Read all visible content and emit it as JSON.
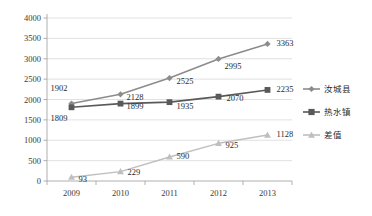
{
  "chart_data": {
    "type": "line",
    "title": "",
    "subtitle": "",
    "xlabel": "",
    "ylabel": "",
    "categories": [
      "2009",
      "2010",
      "2011",
      "2012",
      "2013"
    ],
    "ylim": [
      0,
      4000
    ],
    "ytick_values": [
      0,
      500,
      1000,
      1500,
      2000,
      2500,
      3000,
      3500,
      4000
    ],
    "ytick_labels": [
      "0",
      "500",
      "1000",
      "1500",
      "2000",
      "2500",
      "3000",
      "3500",
      "4000"
    ],
    "grid": true,
    "legend_position": "right",
    "series": [
      {
        "name": "汝城县",
        "marker": "diamond",
        "color": "#8c8c8c",
        "values": [
          1902,
          2128,
          2525,
          2995,
          3363
        ],
        "labels": [
          "1902",
          "2128",
          "2525",
          "2995",
          "3363"
        ]
      },
      {
        "name": "热水镇",
        "marker": "square",
        "color": "#595959",
        "values": [
          1809,
          1899,
          1935,
          2070,
          2235
        ],
        "labels": [
          "1809",
          "1899",
          "1935",
          "2070",
          "2235"
        ]
      },
      {
        "name": "差值",
        "marker": "triangle",
        "color": "#bfbfbf",
        "values": [
          93,
          229,
          590,
          925,
          1128
        ],
        "labels": [
          "93",
          "229",
          "590",
          "925",
          "1128"
        ]
      }
    ]
  },
  "legend": {
    "items": [
      {
        "label": "汝城县",
        "marker": "diamond",
        "color": "#8c8c8c"
      },
      {
        "label": "热水镇",
        "marker": "square",
        "color": "#595959"
      },
      {
        "label": "差值",
        "marker": "triangle",
        "color": "#bfbfbf"
      }
    ]
  },
  "colors": {
    "background": "#ffffff",
    "grid": "#d9d9d9",
    "axis": "#a6a6a6",
    "text": "#2b2b2b",
    "series_1": "#8c8c8c",
    "series_2": "#595959",
    "series_3": "#bfbfbf"
  }
}
